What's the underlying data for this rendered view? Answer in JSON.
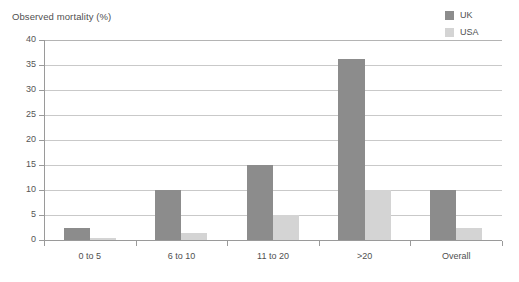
{
  "chart_data": {
    "type": "bar",
    "title": "Observed mortality (%)",
    "xlabel": "",
    "ylabel": "",
    "ylim": [
      0,
      40
    ],
    "ytick_step": 5,
    "yticks": [
      "0",
      "5",
      "10",
      "15",
      "20",
      "25",
      "30",
      "35",
      "40"
    ],
    "grid": true,
    "legend_position": "top-right",
    "categories": [
      "0 to 5",
      "6 to 10",
      "11 to 20",
      ">20",
      "Overall"
    ],
    "series": [
      {
        "name": "UK",
        "color": "#8c8c8c",
        "values": [
          2.5,
          10.0,
          15.0,
          36.3,
          10.0
        ]
      },
      {
        "name": "USA",
        "color": "#d4d4d4",
        "values": [
          0.4,
          1.5,
          5.0,
          10.0,
          2.5
        ]
      }
    ]
  },
  "colors": {
    "uk": "#8c8c8c",
    "usa": "#d4d4d4",
    "gridline": "#c9c9c9",
    "axis": "#9a9a9a",
    "text": "#4f4f4f",
    "background": "#ffffff"
  }
}
